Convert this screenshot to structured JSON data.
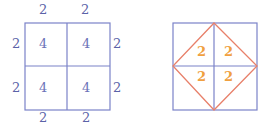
{
  "left_figure": {
    "description": "2x2 grid of squares with side lengths and areas",
    "side_labels": {
      "top": [
        "2",
        "2"
      ],
      "bottom": [
        "2",
        "2"
      ],
      "left": [
        "2",
        "2"
      ],
      "right": [
        "2",
        "2"
      ]
    },
    "cell_areas": [
      "4",
      "4",
      "4",
      "4"
    ]
  },
  "right_figure": {
    "description": "Square with inscribed diamond (rotated square) connecting midpoints",
    "triangle_areas": [
      "2",
      "2",
      "2",
      "2"
    ]
  },
  "colors": {
    "grid": "#6b72c0",
    "label": "#5b63a8",
    "diamond": "#e8806a",
    "diamond_label": "#f0a040"
  }
}
